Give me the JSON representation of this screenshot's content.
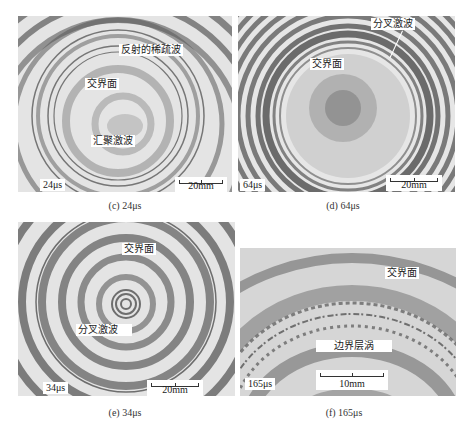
{
  "figure": {
    "panels": [
      {
        "id": "c",
        "caption": "(c) 24μs",
        "time": "24μs",
        "scale": "20mm",
        "annotations": [
          "反射的稀疏波",
          "交界面",
          "汇聚激波"
        ]
      },
      {
        "id": "d",
        "caption": "(d) 64μs",
        "time": "64μs",
        "scale": "20mm",
        "annotations": [
          "分叉激波",
          "交界面"
        ]
      },
      {
        "id": "e",
        "caption": "(e) 34μs",
        "time": "34μs",
        "scale": "20mm",
        "annotations": [
          "交界面",
          "分叉激波"
        ]
      },
      {
        "id": "f",
        "caption": "(f) 165μs",
        "time": "165μs",
        "scale": "10mm",
        "annotations": [
          "交界面",
          "边界层涡"
        ]
      }
    ]
  }
}
